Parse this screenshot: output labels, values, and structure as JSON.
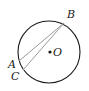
{
  "diagram": {
    "circle": {
      "cx": 49,
      "cy": 52,
      "r": 31,
      "stroke": "#1a1a1a"
    },
    "center": {
      "label": "O",
      "x": 50,
      "y": 52
    },
    "points": {
      "B": {
        "label": "B",
        "x": 64,
        "y": 23
      },
      "A": {
        "label": "A",
        "x": 19,
        "y": 61
      },
      "C": {
        "label": "C",
        "x": 23,
        "y": 70
      }
    },
    "chords": [
      {
        "from": "B",
        "to": "A",
        "stroke": "#9a9a9a"
      },
      {
        "from": "B",
        "to": "C",
        "stroke": "#9a9a9a"
      }
    ]
  }
}
